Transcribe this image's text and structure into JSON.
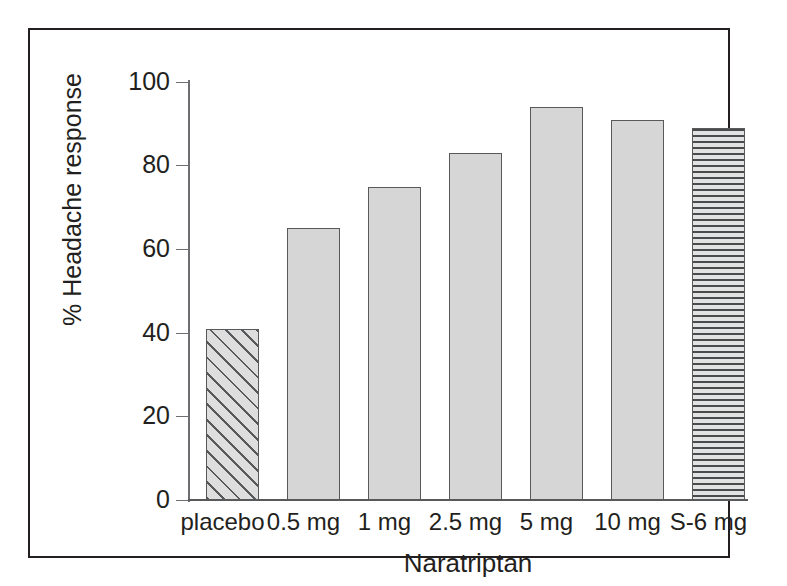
{
  "chart_data": {
    "type": "bar",
    "title": "",
    "subtitle": "",
    "xlabel": "Naratriptan",
    "ylabel": "% Headache response",
    "categories": [
      "placebo",
      "0.5 mg",
      "1 mg",
      "2.5 mg",
      "5 mg",
      "10 mg",
      "S-6 mg"
    ],
    "values": [
      41,
      65,
      75,
      83,
      94,
      91,
      89
    ],
    "series": [
      {
        "name": "% Headache response",
        "values": [
          41,
          65,
          75,
          83,
          94,
          91,
          89
        ]
      }
    ],
    "ylim": [
      0,
      100
    ],
    "yticks": [
      0,
      20,
      40,
      60,
      80,
      100
    ],
    "ytick_labels": [
      "0",
      "20",
      "40",
      "60",
      "80",
      "100"
    ],
    "grid": false,
    "legend": "none",
    "bar_styles": [
      "diagonal-hatch",
      "solid-gray",
      "solid-gray",
      "solid-gray",
      "solid-gray",
      "solid-gray",
      "horizontal-hatch"
    ],
    "colors": {
      "bar_fill": "#d6d6d6",
      "bar_edge": "#58595b",
      "hatch": "#58595b",
      "axis": "#6d6e71",
      "text": "#231f20",
      "frame": "#231f20",
      "background": "#ffffff"
    }
  },
  "axis": {
    "y_title": "% Headache response",
    "x_title": "Naratriptan",
    "y_labels": {
      "t100": "100",
      "t80": "80",
      "t60": "60",
      "t40": "40",
      "t20": "20",
      "t0": "0"
    }
  },
  "x_labels": {
    "c0": "placebo",
    "c1": "0.5 mg",
    "c2": "1 mg",
    "c3": "2.5 mg",
    "c4": "5 mg",
    "c5": "10 mg",
    "c6": "S-6 mg"
  }
}
